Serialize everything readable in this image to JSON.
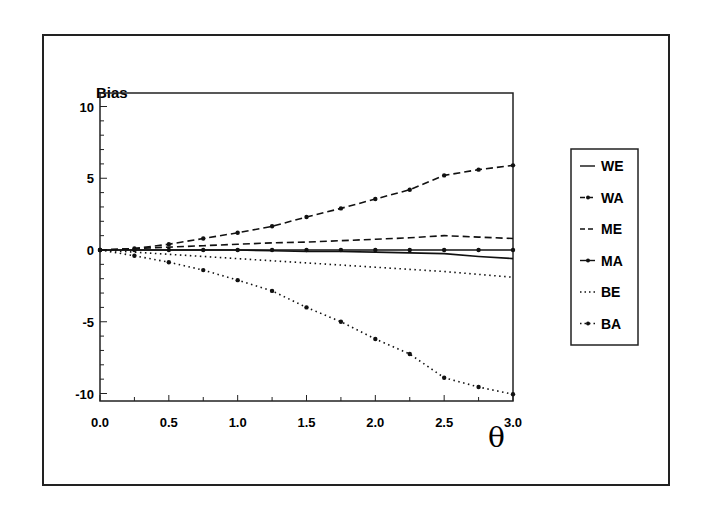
{
  "chart_data": {
    "type": "line",
    "title": "",
    "ylabel": "Bias",
    "xlabel": "θ",
    "xlim": [
      0.0,
      3.0
    ],
    "ylim": [
      -10.5,
      11
    ],
    "xticks": [
      "0.0",
      "0.5",
      "1.0",
      "1.5",
      "2.0",
      "2.5",
      "3.0"
    ],
    "yticks": [
      "10",
      "5",
      "0",
      "-5",
      "-10"
    ],
    "grid": false,
    "legend_position": "right, outside plot",
    "x": [
      0.0,
      0.25,
      0.5,
      0.75,
      1.0,
      1.25,
      1.5,
      1.75,
      2.0,
      2.25,
      2.5,
      2.75,
      3.0
    ],
    "series": [
      {
        "name": "WE",
        "style": "solid",
        "markers": false,
        "values": [
          0.0,
          0.0,
          0.0,
          0.0,
          0.0,
          -0.05,
          -0.1,
          -0.1,
          -0.15,
          -0.2,
          -0.25,
          -0.45,
          -0.6
        ]
      },
      {
        "name": "WA",
        "style": "dashed",
        "markers": true,
        "values": [
          0.0,
          0.1,
          0.4,
          0.8,
          1.2,
          1.65,
          2.3,
          2.9,
          3.55,
          4.2,
          5.2,
          5.6,
          5.9
        ]
      },
      {
        "name": "ME",
        "style": "dashed",
        "markers": false,
        "values": [
          0.0,
          0.1,
          0.2,
          0.3,
          0.4,
          0.5,
          0.55,
          0.65,
          0.75,
          0.85,
          1.0,
          0.9,
          0.8
        ]
      },
      {
        "name": "MA",
        "style": "solid",
        "markers": true,
        "values": [
          0.0,
          0.0,
          0.0,
          0.0,
          0.0,
          0.0,
          0.0,
          0.0,
          0.0,
          0.0,
          0.0,
          0.0,
          0.0
        ]
      },
      {
        "name": "BE",
        "style": "dotted",
        "markers": false,
        "values": [
          0.0,
          -0.15,
          -0.3,
          -0.45,
          -0.6,
          -0.75,
          -0.9,
          -1.05,
          -1.2,
          -1.35,
          -1.5,
          -1.7,
          -1.9
        ]
      },
      {
        "name": "BA",
        "style": "dotted",
        "markers": true,
        "values": [
          0.0,
          -0.4,
          -0.85,
          -1.4,
          -2.1,
          -2.85,
          -4.0,
          -5.0,
          -6.2,
          -7.25,
          -8.9,
          -9.55,
          -10.05
        ]
      }
    ]
  },
  "labels": {
    "ylabel": "Bias",
    "xlabel": "θ",
    "xticks": [
      "0.0",
      "0.5",
      "1.0",
      "1.5",
      "2.0",
      "2.5",
      "3.0"
    ],
    "yticks": [
      "10",
      "5",
      "0",
      "-5",
      "-10"
    ],
    "legend": [
      "WE",
      "WA",
      "ME",
      "MA",
      "BE",
      "BA"
    ]
  },
  "colors": {
    "ink": "#111111",
    "background": "#ffffff"
  }
}
